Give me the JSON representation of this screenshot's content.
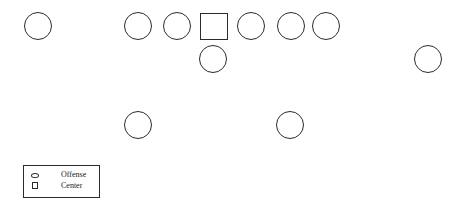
{
  "diagram": {
    "title": "",
    "stroke_color": "#2b2b2b",
    "players": [
      {
        "shape": "circle",
        "role": "offense",
        "cx": 38,
        "cy": 26
      },
      {
        "shape": "circle",
        "role": "offense",
        "cx": 138,
        "cy": 26
      },
      {
        "shape": "circle",
        "role": "offense",
        "cx": 177,
        "cy": 26
      },
      {
        "shape": "square",
        "role": "center",
        "cx": 214,
        "cy": 26
      },
      {
        "shape": "circle",
        "role": "offense",
        "cx": 251,
        "cy": 26
      },
      {
        "shape": "circle",
        "role": "offense",
        "cx": 291,
        "cy": 26
      },
      {
        "shape": "circle",
        "role": "offense",
        "cx": 326,
        "cy": 26
      },
      {
        "shape": "circle",
        "role": "offense",
        "cx": 213,
        "cy": 59
      },
      {
        "shape": "circle",
        "role": "offense",
        "cx": 428,
        "cy": 59
      },
      {
        "shape": "circle",
        "role": "offense",
        "cx": 138,
        "cy": 125
      },
      {
        "shape": "circle",
        "role": "offense",
        "cx": 290,
        "cy": 125
      }
    ]
  },
  "legend": {
    "items": [
      {
        "symbol": "oval",
        "label": "Offense"
      },
      {
        "symbol": "square",
        "label": "Center"
      }
    ]
  }
}
